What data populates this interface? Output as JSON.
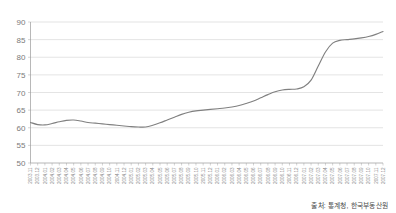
{
  "source_note": "출처: 통계청, 한국부동산원",
  "chart_data": {
    "type": "line",
    "title": "",
    "xlabel": "",
    "ylabel": "",
    "ylim": [
      50,
      90
    ],
    "ytick_step": 5,
    "yticks": [
      50,
      55,
      60,
      65,
      70,
      75,
      80,
      85,
      90
    ],
    "grid": true,
    "legend": "none",
    "line_color": "#808080",
    "grid_color": "#d2d2d2",
    "axis_color": "#9a9a9a",
    "categories": [
      "2003.11",
      "2003.12",
      "2004.01",
      "2004.02",
      "2004.03",
      "2004.04",
      "2004.05",
      "2004.06",
      "2004.07",
      "2004.08",
      "2004.09",
      "2004.10",
      "2004.11",
      "2004.12",
      "2005.01",
      "2005.02",
      "2005.03",
      "2005.04",
      "2005.05",
      "2005.06",
      "2005.07",
      "2005.08",
      "2005.09",
      "2005.10",
      "2005.11",
      "2005.12",
      "2006.01",
      "2006.02",
      "2006.03",
      "2006.04",
      "2006.05",
      "2006.06",
      "2006.07",
      "2006.08",
      "2006.09",
      "2006.10",
      "2006.11",
      "2006.12",
      "2007.01",
      "2007.02",
      "2007.03",
      "2007.04",
      "2007.05",
      "2007.06",
      "2007.07",
      "2007.08",
      "2007.09",
      "2007.10",
      "2007.11",
      "2007.12"
    ],
    "values": [
      61.5,
      60.9,
      60.8,
      61.2,
      61.7,
      62.1,
      62.2,
      61.9,
      61.5,
      61.3,
      61.1,
      60.9,
      60.7,
      60.5,
      60.3,
      60.2,
      60.2,
      60.7,
      61.4,
      62.2,
      63.0,
      63.8,
      64.4,
      64.8,
      65.0,
      65.2,
      65.4,
      65.6,
      65.9,
      66.3,
      66.9,
      67.6,
      68.5,
      69.4,
      70.2,
      70.7,
      70.9,
      71.0,
      71.6,
      73.5,
      77.5,
      81.5,
      84.0,
      84.8,
      85.0,
      85.2,
      85.5,
      85.9,
      86.5,
      87.3
    ]
  }
}
